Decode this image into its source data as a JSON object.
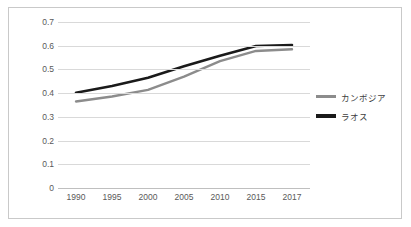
{
  "chart_data": {
    "type": "line",
    "title": "",
    "xlabel": "",
    "ylabel": "",
    "categories": [
      "1990",
      "1995",
      "2000",
      "2005",
      "2010",
      "2015",
      "2017"
    ],
    "x": [
      1990,
      1995,
      2000,
      2005,
      2010,
      2015,
      2017
    ],
    "ylim": [
      0,
      0.7
    ],
    "yticks": [
      "0",
      "0.1",
      "0.2",
      "0.3",
      "0.4",
      "0.5",
      "0.6",
      "0.7"
    ],
    "ytick_values": [
      0,
      0.1,
      0.2,
      0.3,
      0.4,
      0.5,
      0.6,
      0.7
    ],
    "grid": true,
    "legend_position": "right",
    "series": [
      {
        "name": "カンボジア",
        "color": "#8c8c8c",
        "values": [
          0.365,
          0.386,
          0.414,
          0.47,
          0.535,
          0.578,
          0.585
        ]
      },
      {
        "name": "ラオス",
        "color": "#1a1a1a",
        "values": [
          0.402,
          0.43,
          0.465,
          0.513,
          0.558,
          0.599,
          0.603
        ]
      }
    ]
  },
  "legend": {
    "items": [
      {
        "label": "カンボジア",
        "color": "#8c8c8c"
      },
      {
        "label": "ラオス",
        "color": "#1a1a1a"
      }
    ]
  },
  "colors": {
    "cambodia_line": "#8c8c8c",
    "laos_line": "#1a1a1a",
    "gridline": "#d9d9d9",
    "axis": "#bfbfbf",
    "frame_border": "#c9c9c9",
    "tick_text": "#595959",
    "background": "#ffffff"
  }
}
